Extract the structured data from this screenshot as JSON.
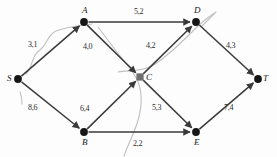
{
  "diagram": {
    "colors": {
      "edge": "#3a3a3a",
      "node": "#161616",
      "node_c": "#6e6e6e",
      "pencil": "#b9b9b9",
      "background": "#fdfdfd"
    },
    "nodes": [
      {
        "id": "S",
        "label": "S",
        "x": 18,
        "y": 79,
        "shape": "disc",
        "label_dx": -11,
        "label_dy": -5
      },
      {
        "id": "A",
        "label": "A",
        "x": 84,
        "y": 22,
        "shape": "disc",
        "label_dx": -2,
        "label_dy": -16
      },
      {
        "id": "B",
        "label": "B",
        "x": 84,
        "y": 132,
        "shape": "disc",
        "label_dx": -2,
        "label_dy": 6
      },
      {
        "id": "C",
        "label": "C",
        "x": 140,
        "y": 77,
        "shape": "square",
        "label_dx": 6,
        "label_dy": -4
      },
      {
        "id": "D",
        "label": "D",
        "x": 196,
        "y": 22,
        "shape": "disc",
        "label_dx": -2,
        "label_dy": -16
      },
      {
        "id": "E",
        "label": "E",
        "x": 196,
        "y": 132,
        "shape": "disc",
        "label_dx": -2,
        "label_dy": 6
      },
      {
        "id": "T",
        "label": "T",
        "x": 258,
        "y": 79,
        "shape": "disc",
        "label_dx": 5,
        "label_dy": -5
      }
    ],
    "edges": [
      {
        "from": "S",
        "to": "A",
        "capacity": 3,
        "flow": 1,
        "label": "3,1",
        "label_x": 28,
        "label_y": 41
      },
      {
        "from": "S",
        "to": "B",
        "capacity": 8,
        "flow": 6,
        "label": "8,6",
        "label_x": 28,
        "label_y": 104
      },
      {
        "from": "A",
        "to": "D",
        "capacity": 5,
        "flow": 2,
        "label": "5,2",
        "label_x": 134,
        "label_y": 8
      },
      {
        "from": "A",
        "to": "C",
        "capacity": 4,
        "flow": 0,
        "label": "4,0",
        "label_x": 83,
        "label_y": 43
      },
      {
        "from": "B",
        "to": "C",
        "capacity": 6,
        "flow": 4,
        "label": "6,4",
        "label_x": 80,
        "label_y": 105
      },
      {
        "from": "B",
        "to": "E",
        "capacity": 2,
        "flow": 2,
        "label": "2,2",
        "label_x": 133,
        "label_y": 140
      },
      {
        "from": "C",
        "to": "D",
        "capacity": 4,
        "flow": 2,
        "label": "4,2",
        "label_x": 146,
        "label_y": 42
      },
      {
        "from": "C",
        "to": "E",
        "capacity": 5,
        "flow": 3,
        "label": "5,3",
        "label_x": 152,
        "label_y": 104
      },
      {
        "from": "D",
        "to": "T",
        "capacity": 4,
        "flow": 3,
        "label": "4,3",
        "label_x": 226,
        "label_y": 42
      },
      {
        "from": "E",
        "to": "T",
        "capacity": 7,
        "flow": 4,
        "label": "7,4",
        "label_x": 224,
        "label_y": 104
      }
    ],
    "annotations": [
      {
        "name": "pencil-stroke-left",
        "d": "M 26 74 C 34 66 30 57 40 50 C 48 44 46 36 56 31 C 66 27 76 26 92 24"
      },
      {
        "name": "pencil-stroke-mid",
        "d": "M 98 27 C 108 40 118 54 128 66 C 134 73 138 80 140 88 C 143 102 140 118 133 134 C 129 144 126 150 124 156"
      },
      {
        "name": "pencil-stroke-cross",
        "d": "M 118 72 C 128 70 140 72 152 66 C 166 58 182 42 196 28 C 204 20 210 16 216 12"
      },
      {
        "name": "pencil-arrow-d",
        "d": "M 214 14 L 202 26"
      },
      {
        "name": "pencil-tick-s",
        "d": "M 20 92 C 22 97 22 100 22 104"
      }
    ]
  }
}
